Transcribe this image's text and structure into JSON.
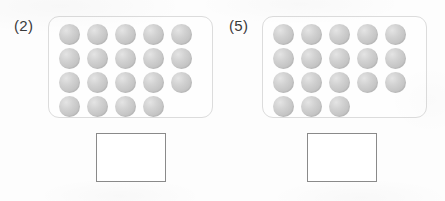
{
  "worksheet": {
    "type": "counting-exercise",
    "background_color": "#fdfdfd",
    "counter_color": "#c6c6c6",
    "tray_border_color": "#dcdcdc",
    "answer_box_border_color": "#8a8a8a",
    "label_color": "#3a3a3a"
  },
  "problems": [
    {
      "label": "(2)",
      "counter_rows": [
        5,
        5,
        5,
        4
      ],
      "counter_total": 19,
      "answer_value": "",
      "answer_placeholder": ""
    },
    {
      "label": "(5)",
      "counter_rows": [
        5,
        5,
        5,
        3
      ],
      "counter_total": 18,
      "answer_value": "",
      "answer_placeholder": ""
    }
  ]
}
